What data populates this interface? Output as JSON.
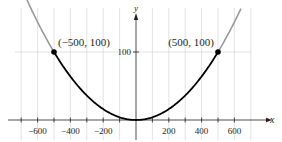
{
  "chart_data": {
    "type": "line",
    "title": "",
    "xlabel": "x",
    "ylabel": "y",
    "xlim": [
      -800,
      800
    ],
    "ylim": [
      -20,
      160
    ],
    "grid": true,
    "x_ticks": [
      -600,
      -400,
      -200,
      200,
      400,
      600
    ],
    "x_tick_labels": [
      "−600",
      "−400",
      "−200",
      "200",
      "400",
      "600"
    ],
    "y_ticks": [
      100
    ],
    "y_tick_labels": [
      "100"
    ],
    "series": [
      {
        "name": "y = x^2/2500 (highlighted segment)",
        "equation": "y = x^2 / 2500",
        "domain": [
          -500,
          500
        ],
        "color": "#000000",
        "x": [
          -500,
          -400,
          -300,
          -200,
          -100,
          0,
          100,
          200,
          300,
          400,
          500
        ],
        "y": [
          100,
          64,
          36,
          16,
          4,
          0,
          4,
          16,
          36,
          64,
          100
        ]
      },
      {
        "name": "y = x^2/2500 (extension)",
        "equation": "y = x^2 / 2500",
        "domain_left": [
          -710,
          -500
        ],
        "domain_right": [
          500,
          640
        ],
        "color": "#9a9a9a",
        "x": [
          -710,
          -600,
          -500,
          500,
          600,
          640
        ],
        "y": [
          201.6,
          144,
          100,
          100,
          144,
          163.8
        ]
      }
    ],
    "points": [
      {
        "x": -500,
        "y": 100,
        "label": "(−500, 100)"
      },
      {
        "x": 500,
        "y": 100,
        "label": "(500, 100)"
      }
    ],
    "annotations": [
      "(−500, 100)",
      "(500, 100)"
    ],
    "colors": {
      "curve": "#000000",
      "extension": "#9a9a9a",
      "grid": "#cfcfcf",
      "axis": "#231f20"
    }
  }
}
